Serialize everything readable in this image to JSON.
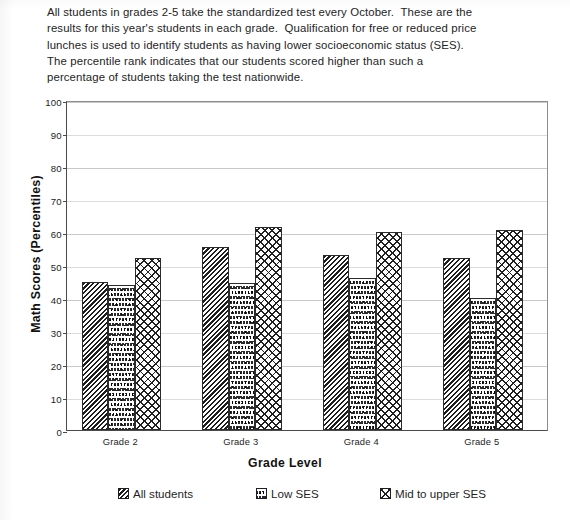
{
  "document": {
    "intro_lines": [
      "All students in grades 2-5 take the standardized test every October.  These are the",
      "results for this year's students in each grade.  Qualification for free or reduced price",
      "lunches is used to identify students as having lower socioeconomic status (SES).",
      "The percentile rank indicates that our students scored higher than such a",
      "percentage of students taking the test nationwide."
    ]
  },
  "chart_data": {
    "type": "bar",
    "title": "",
    "xlabel": "Grade Level",
    "ylabel": "Math Scores (Percentiles)",
    "categories": [
      "Grade 2",
      "Grade 3",
      "Grade 4",
      "Grade 5"
    ],
    "series": [
      {
        "name": "All students",
        "values": [
          45,
          55.5,
          53,
          52
        ],
        "pattern": "diagonal-hatch"
      },
      {
        "name": "Low SES",
        "values": [
          44,
          44.5,
          46,
          40
        ],
        "pattern": "wavy-lines"
      },
      {
        "name": "Mid to upper SES",
        "values": [
          52,
          61.5,
          60,
          60.5
        ],
        "pattern": "crosshatch"
      }
    ],
    "ylim": [
      0,
      100
    ],
    "yticks": [
      0,
      10,
      20,
      30,
      40,
      50,
      60,
      70,
      80,
      90,
      100
    ],
    "grid": true,
    "legend_position": "bottom"
  },
  "legend": {
    "items": [
      {
        "label": "All students"
      },
      {
        "label": "Low SES"
      },
      {
        "label": "Mid to upper SES"
      }
    ]
  }
}
